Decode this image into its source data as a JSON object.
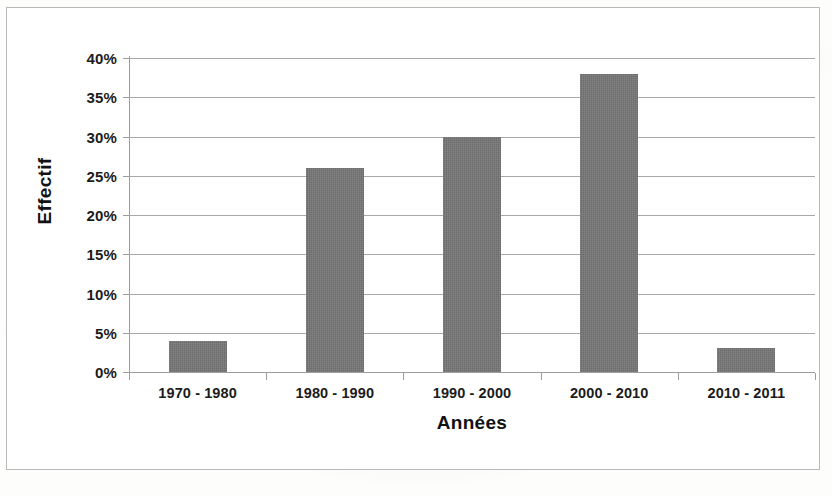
{
  "chart_data": {
    "type": "bar",
    "title": "",
    "xlabel": "Années",
    "ylabel": "Effectif",
    "categories": [
      "1970 - 1980",
      "1980 - 1990",
      "1990 - 2000",
      "2000 - 2010",
      "2010 - 2011"
    ],
    "values": [
      4,
      26,
      30,
      38,
      3
    ],
    "value_labels": [
      "4%",
      "26%",
      "30%",
      "38%",
      "3%"
    ],
    "ylim": [
      0,
      40
    ],
    "ytick_step": 5,
    "ytick_labels": [
      "40%",
      "35%",
      "30%",
      "25%",
      "20%",
      "15%",
      "10%",
      "5%",
      "0%"
    ],
    "ytick_values": [
      40,
      35,
      30,
      25,
      20,
      15,
      10,
      5,
      0
    ],
    "grid": true,
    "legend": false,
    "legend_position": "none",
    "series": [
      {
        "name": "Effectif",
        "values": [
          4,
          26,
          30,
          38,
          3
        ]
      }
    ],
    "colors": {
      "bar": "#757576",
      "gridline": "#a8a8a8",
      "axis": "#9d9d9d",
      "frame": "#b9b9b9",
      "text": "#1b1b1b",
      "plot_background": "#ffffff"
    }
  }
}
